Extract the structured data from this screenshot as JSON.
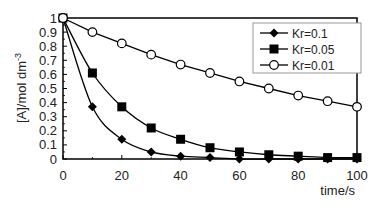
{
  "chart_data": {
    "type": "line",
    "title": "",
    "xlabel": "time/s",
    "ylabel": "[A]/mol dm",
    "ylabel_superscript": "-3",
    "xlim": [
      0,
      100
    ],
    "ylim": [
      0,
      1
    ],
    "x_ticks": [
      "0",
      "20",
      "40",
      "60",
      "80",
      "100"
    ],
    "y_ticks": [
      "0",
      "0.1",
      "0.2",
      "0.3",
      "0.4",
      "0.5",
      "0.6",
      "0.7",
      "0.8",
      "0.9",
      "1"
    ],
    "grid": false,
    "legend_position": "upper right",
    "x": [
      0,
      10,
      20,
      30,
      40,
      50,
      60,
      70,
      80,
      90,
      100
    ],
    "series": [
      {
        "name": "Kr=0.1",
        "marker": "diamond-filled",
        "values": [
          1,
          0.37,
          0.14,
          0.05,
          0.02,
          0.01,
          0.0,
          0.0,
          0.0,
          0.0,
          0.0
        ]
      },
      {
        "name": "Kr=0.05",
        "marker": "square-filled",
        "values": [
          1,
          0.61,
          0.37,
          0.22,
          0.14,
          0.08,
          0.05,
          0.03,
          0.02,
          0.01,
          0.01
        ]
      },
      {
        "name": "Kr=0.01",
        "marker": "circle-open",
        "values": [
          1,
          0.9,
          0.82,
          0.74,
          0.67,
          0.61,
          0.55,
          0.5,
          0.45,
          0.41,
          0.37
        ]
      }
    ]
  }
}
